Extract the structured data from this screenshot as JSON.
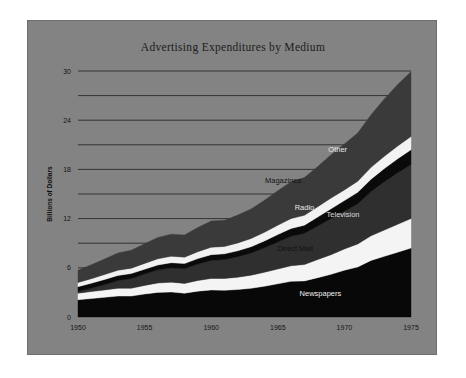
{
  "figure": {
    "title": "Advertising Expenditures by Medium",
    "panel_color": "#838383",
    "page_background": "#ffffff"
  },
  "chart_data": {
    "type": "area",
    "title": "Advertising Expenditures by Medium",
    "xlabel": "",
    "ylabel": "Billions of Dollars",
    "stacked": true,
    "grid": true,
    "legend_position": "inline-labels",
    "xlim": [
      1950,
      1975
    ],
    "ylim": [
      0,
      30
    ],
    "x_ticks": [
      1950,
      1955,
      1960,
      1965,
      1970,
      1975
    ],
    "x_tick_labels": [
      "1950",
      "1955",
      "1960",
      "1965",
      "1970",
      "1975"
    ],
    "y_ticks": [
      0,
      3,
      6,
      9,
      12,
      15,
      18,
      21,
      24,
      27,
      30
    ],
    "y_tick_labels": [
      "0",
      "",
      "6",
      "",
      "12",
      "",
      "18",
      "",
      "24",
      "",
      "30"
    ],
    "x": [
      1950,
      1951,
      1952,
      1953,
      1954,
      1955,
      1956,
      1957,
      1958,
      1959,
      1960,
      1961,
      1962,
      1963,
      1964,
      1965,
      1966,
      1967,
      1968,
      1969,
      1970,
      1971,
      1972,
      1973,
      1974,
      1975
    ],
    "series": [
      {
        "name": "Newspapers",
        "color": "#080808",
        "label_color": "#efefef",
        "values": [
          2.1,
          2.25,
          2.4,
          2.55,
          2.55,
          2.8,
          3.0,
          3.05,
          2.9,
          3.15,
          3.3,
          3.25,
          3.35,
          3.5,
          3.75,
          4.05,
          4.35,
          4.4,
          4.8,
          5.2,
          5.7,
          6.1,
          6.9,
          7.4,
          7.9,
          8.4
        ],
        "units": "billions of dollars"
      },
      {
        "name": "Direct Mail",
        "color": "#f4f4f4",
        "label_color": "#111111",
        "values": [
          0.8,
          0.85,
          0.9,
          0.95,
          0.95,
          1.05,
          1.15,
          1.2,
          1.2,
          1.3,
          1.4,
          1.45,
          1.5,
          1.6,
          1.7,
          1.8,
          1.9,
          2.0,
          2.2,
          2.4,
          2.6,
          2.8,
          3.0,
          3.2,
          3.4,
          3.6
        ],
        "units": "billions of dollars"
      },
      {
        "name": "Television",
        "color": "#2f2f2f",
        "label_color": "#dcdcdc",
        "values": [
          0.2,
          0.4,
          0.65,
          0.95,
          1.2,
          1.4,
          1.6,
          1.75,
          1.8,
          2.0,
          2.2,
          2.3,
          2.5,
          2.7,
          3.0,
          3.3,
          3.6,
          3.8,
          4.1,
          4.4,
          4.6,
          4.9,
          5.4,
          5.9,
          6.3,
          6.6
        ],
        "units": "billions of dollars"
      },
      {
        "name": "Radio",
        "color": "#0a0a0a",
        "label_color": "#e8e8e8",
        "values": [
          0.6,
          0.62,
          0.63,
          0.62,
          0.6,
          0.58,
          0.6,
          0.62,
          0.62,
          0.67,
          0.7,
          0.7,
          0.73,
          0.78,
          0.83,
          0.9,
          0.95,
          1.0,
          1.1,
          1.2,
          1.3,
          1.4,
          1.5,
          1.6,
          1.7,
          1.8
        ],
        "units": "billions of dollars"
      },
      {
        "name": "Magazines",
        "color": "#f2f2f2",
        "label_color": "#111111",
        "values": [
          0.5,
          0.55,
          0.6,
          0.63,
          0.65,
          0.7,
          0.75,
          0.78,
          0.78,
          0.85,
          0.9,
          0.9,
          0.95,
          1.0,
          1.05,
          1.15,
          1.2,
          1.2,
          1.25,
          1.3,
          1.3,
          1.35,
          1.45,
          1.5,
          1.55,
          1.6
        ],
        "units": "billions of dollars"
      },
      {
        "name": "Other",
        "color": "#3a3a3a",
        "label_color": "#eaeaea",
        "values": [
          1.5,
          1.7,
          1.9,
          2.1,
          2.2,
          2.4,
          2.6,
          2.7,
          2.7,
          2.95,
          3.2,
          3.2,
          3.4,
          3.6,
          3.9,
          4.2,
          4.5,
          4.6,
          4.9,
          5.3,
          5.6,
          5.9,
          6.4,
          7.0,
          7.5,
          7.9
        ],
        "units": "billions of dollars"
      }
    ],
    "series_label_positions": [
      {
        "name": "Newspapers",
        "x": 1968.2,
        "y": 2.6
      },
      {
        "name": "Direct Mail",
        "x": 1966.3,
        "y": 8.1
      },
      {
        "name": "Radio",
        "x": 1967.0,
        "y": 13.1
      },
      {
        "name": "Television",
        "x": 1969.9,
        "y": 12.2
      },
      {
        "name": "Magazines",
        "x": 1965.4,
        "y": 16.4
      },
      {
        "name": "Other",
        "x": 1969.5,
        "y": 20.1
      }
    ]
  }
}
